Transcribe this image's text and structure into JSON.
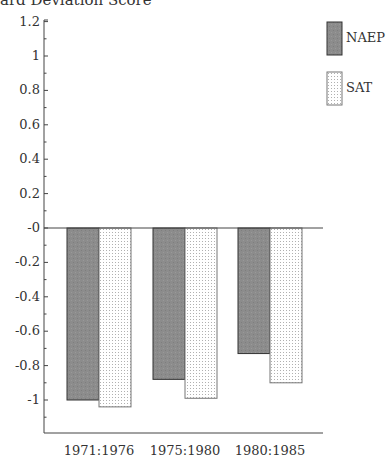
{
  "chart_data": {
    "type": "bar",
    "xlabel": "",
    "ylabel": "Standard Deviation Score",
    "categories": [
      "1971:1976",
      "1975:1980",
      "1980:1985"
    ],
    "series": [
      {
        "name": "NAEP",
        "values": [
          -1.0,
          -0.88,
          -0.73
        ],
        "color": "#8a8a8a",
        "pattern": "solid"
      },
      {
        "name": "SAT",
        "values": [
          -1.04,
          -0.99,
          -0.9
        ],
        "color": "#f4f4f4",
        "pattern": "dotted"
      }
    ],
    "ylim": [
      -1.2,
      1.2
    ],
    "yticks": [
      1.2,
      1,
      0.8,
      0.6,
      0.4,
      0.2,
      0,
      -0.2,
      -0.4,
      -0.6,
      -0.8,
      -1
    ],
    "ytick_labels": [
      "1.2",
      "1",
      "0.8",
      "0.6",
      "0.4",
      "0.2",
      "-0",
      "-0.2",
      "-0.4",
      "-0.6",
      "-0.8",
      "-1"
    ],
    "grid": false,
    "zero_line": true,
    "legend_position": "right"
  },
  "title_visible": "ard Deviation Score",
  "legend": [
    {
      "label": "NAEP"
    },
    {
      "label": "SAT"
    }
  ]
}
